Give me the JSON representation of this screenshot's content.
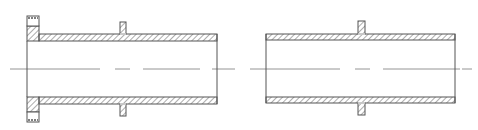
{
  "drawing": {
    "title": "Pipe sections with flange and collar (longitudinal section)",
    "stroke_color": "#555555",
    "hatch_color": "#666666",
    "centerline_color": "#888888",
    "background": "#ffffff",
    "centerline_y": 69,
    "parts": [
      {
        "id": "left-pipe-flanged",
        "x_start": 27,
        "x_end": 217,
        "top_wall": [
          34,
          41
        ],
        "bottom_wall": [
          97,
          104
        ],
        "flange": {
          "x": [
            27,
            39
          ],
          "top": [
            16,
            41
          ],
          "bottom": [
            97,
            122
          ]
        },
        "collar": {
          "x": [
            120,
            126
          ],
          "top": [
            22,
            34
          ],
          "bottom": [
            104,
            116
          ]
        }
      },
      {
        "id": "right-pipe",
        "x_start": 266,
        "x_end": 455,
        "top_wall": [
          34,
          40
        ],
        "bottom_wall": [
          97,
          103
        ],
        "collar": {
          "x": [
            358,
            365
          ],
          "top": [
            21,
            34
          ],
          "bottom": [
            103,
            115
          ]
        }
      }
    ]
  }
}
